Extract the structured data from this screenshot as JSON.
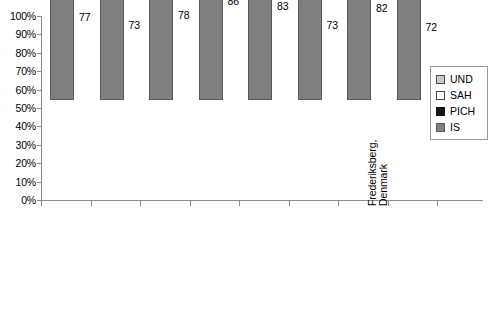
{
  "chart_data": {
    "type": "bar",
    "stacked": true,
    "normalized_percent": true,
    "title": "",
    "xlabel": "",
    "ylabel": "",
    "ylim": [
      0,
      100
    ],
    "ytick_labels": [
      "100%",
      "90%",
      "80%",
      "70%",
      "60%",
      "50%",
      "40%",
      "30%",
      "20%",
      "10%",
      "0%"
    ],
    "ytick_values": [
      100,
      90,
      80,
      70,
      60,
      50,
      40,
      30,
      20,
      10,
      0
    ],
    "grid": false,
    "legend_position": "right",
    "categories": [
      "Dijon, France",
      "Perth, Australia",
      "Umbria, Italy",
      "Rochester, USA",
      "Oxfordshire, England",
      "Frederiksberg, Denmark",
      "Aosta, Italy",
      "Soderhamn, Sweden"
    ],
    "category_display": [
      "Dijon, France",
      "Perth, Australia",
      "Umbria, Italy",
      "Rochester, USA",
      "Oxfordshire, England",
      "Aosta, Italy",
      "Frederiksberg,\nDenmark",
      "Soderhamn, Sweden"
    ],
    "category_order": [
      "Dijon, France",
      "Perth, Australia",
      "Umbria, Italy",
      "Rochester, USA",
      "Oxfordshire, England",
      "Aosta, Italy",
      "Frederiksberg, Denmark",
      "Soderhamn, Sweden"
    ],
    "series": [
      {
        "name": "IS",
        "color": "#808080",
        "values": [
          77,
          73,
          78,
          86,
          83,
          73,
          82,
          72
        ]
      },
      {
        "name": "PICH",
        "color": "#151515",
        "values": [
          11,
          10,
          11,
          9,
          10,
          15,
          8,
          10
        ]
      },
      {
        "name": "SAH",
        "color": "#ffffff",
        "values": [
          2,
          5,
          5,
          5,
          5,
          3,
          1,
          2
        ]
      },
      {
        "name": "UND",
        "color": "#cbcbcb",
        "values": [
          10,
          12,
          6,
          0,
          2,
          9,
          9,
          15
        ]
      }
    ],
    "stack_order_bottom_to_top": [
      "IS",
      "PICH",
      "SAH",
      "UND"
    ]
  },
  "legend": {
    "items": [
      {
        "label": "UND",
        "color": "#cbcbcb"
      },
      {
        "label": "SAH",
        "color": "#ffffff"
      },
      {
        "label": "PICH",
        "color": "#151515"
      },
      {
        "label": "IS",
        "color": "#808080"
      }
    ]
  },
  "axis": {
    "y_ticks": [
      {
        "label": "100%"
      },
      {
        "label": "90%"
      },
      {
        "label": "80%"
      },
      {
        "label": "70%"
      },
      {
        "label": "60%"
      },
      {
        "label": "50%"
      },
      {
        "label": "40%"
      },
      {
        "label": "30%"
      },
      {
        "label": "20%"
      },
      {
        "label": "10%"
      },
      {
        "label": "0%"
      }
    ]
  },
  "bars": [
    {
      "category": "Dijon, France",
      "IS": 77,
      "PICH": 11,
      "SAH": 2,
      "UND": 10,
      "labels": {
        "IS": "77",
        "PICH": "11",
        "SAH": "2",
        "UND": "10"
      }
    },
    {
      "category": "Perth, Australia",
      "IS": 73,
      "PICH": 10,
      "SAH": 5,
      "UND": 12,
      "labels": {
        "IS": "73",
        "PICH": "10",
        "SAH": "5",
        "UND": "12"
      }
    },
    {
      "category": "Umbria, Italy",
      "IS": 78,
      "PICH": 11,
      "SAH": 5,
      "UND": 6,
      "labels": {
        "IS": "78",
        "PICH": "11",
        "SAH": "5",
        "UND": "6"
      }
    },
    {
      "category": "Rochester, USA",
      "IS": 86,
      "PICH": 9,
      "SAH": 5,
      "UND": 0,
      "labels": {
        "IS": "86",
        "PICH": "9",
        "SAH": "5",
        "UND": ""
      }
    },
    {
      "category": "Oxfordshire, England",
      "IS": 83,
      "PICH": 10,
      "SAH": 5,
      "UND": 2,
      "labels": {
        "IS": "83",
        "PICH": "10",
        "SAH": "5",
        "UND": "2"
      }
    },
    {
      "category": "Aosta, Italy",
      "IS": 73,
      "PICH": 15,
      "SAH": 3,
      "UND": 9,
      "labels": {
        "IS": "73",
        "PICH": "15",
        "SAH": "3",
        "UND": "9"
      }
    },
    {
      "category": "Frederiksberg, Denmark",
      "IS": 82,
      "PICH": 8,
      "SAH": 1,
      "UND": 9,
      "labels": {
        "IS": "82",
        "PICH": "8",
        "SAH": "1",
        "UND": "9"
      }
    },
    {
      "category": "Soderhamn, Sweden",
      "IS": 72,
      "PICH": 10,
      "SAH": 2,
      "UND": 15,
      "labels": {
        "IS": "72",
        "PICH": "10",
        "SAH": "2",
        "UND": "15"
      }
    }
  ],
  "x_labels": [
    "Dijon, France",
    "Perth, Australia",
    "Umbria, Italy",
    "Rochester, USA",
    "Oxfordshire, England",
    "Aosta, Italy",
    "Frederiksberg,",
    "Denmark",
    "Soderhamn, Sweden"
  ]
}
